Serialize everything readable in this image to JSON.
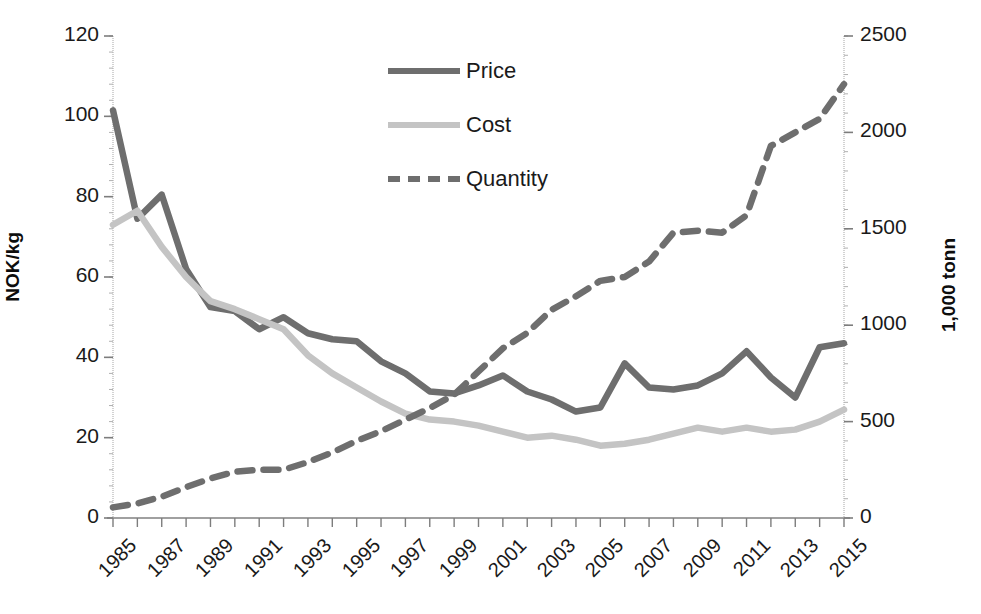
{
  "chart_data": {
    "type": "line",
    "title": "",
    "xlabel": "",
    "x": [
      1985,
      1986,
      1987,
      1988,
      1989,
      1990,
      1991,
      1992,
      1993,
      1994,
      1995,
      1996,
      1997,
      1998,
      1999,
      2000,
      2001,
      2002,
      2003,
      2004,
      2005,
      2006,
      2007,
      2008,
      2009,
      2010,
      2011,
      2012,
      2013,
      2014,
      2015
    ],
    "xtick_labels": [
      "1985",
      "1987",
      "1989",
      "1991",
      "1993",
      "1995",
      "1997",
      "1999",
      "2001",
      "2003",
      "2005",
      "2007",
      "2009",
      "2011",
      "2013",
      "2015"
    ],
    "xlim": [
      1985,
      2015
    ],
    "grid": false,
    "legend_position": "top-center",
    "axes": [
      {
        "id": "left",
        "label": "NOK/kg",
        "ticks": [
          0,
          20,
          40,
          60,
          80,
          100,
          120
        ],
        "lim": [
          0,
          120
        ]
      },
      {
        "id": "right",
        "label": "1,000 tonn",
        "ticks": [
          0,
          500,
          1000,
          1500,
          2000,
          2500
        ],
        "lim": [
          0,
          2500
        ]
      }
    ],
    "series": [
      {
        "name": "Price",
        "axis": "left",
        "style": "solid",
        "color": "#6e6e6e",
        "values": [
          101.5,
          74.5,
          80.5,
          62.0,
          52.5,
          51.5,
          47.0,
          50.0,
          46.0,
          44.5,
          44.0,
          39.0,
          36.0,
          31.5,
          31.0,
          33.0,
          35.5,
          31.5,
          29.5,
          26.5,
          27.5,
          38.5,
          32.5,
          32.0,
          33.0,
          36.0,
          41.5,
          35.0,
          30.0,
          42.5,
          43.5
        ]
      },
      {
        "name": "Cost",
        "axis": "left",
        "style": "solid",
        "color": "#c4c4c4",
        "values": [
          73.0,
          76.5,
          67.5,
          60.0,
          54.0,
          52.0,
          49.5,
          47.0,
          40.5,
          36.0,
          32.5,
          29.0,
          26.0,
          24.5,
          24.0,
          23.0,
          21.5,
          20.0,
          20.5,
          19.5,
          18.0,
          18.5,
          19.5,
          21.0,
          22.5,
          21.5,
          22.5,
          21.5,
          22.0,
          24.0,
          27.0
        ]
      },
      {
        "name": "Quantity",
        "axis": "right",
        "style": "dashed",
        "color": "#6e6e6e",
        "values": [
          55,
          75,
          110,
          160,
          205,
          240,
          250,
          250,
          290,
          340,
          400,
          450,
          510,
          570,
          640,
          760,
          880,
          960,
          1080,
          1150,
          1230,
          1250,
          1330,
          1480,
          1490,
          1480,
          1570,
          1930,
          2000,
          2070,
          2250
        ]
      }
    ]
  },
  "legend": {
    "items": [
      {
        "label": "Price"
      },
      {
        "label": "Cost"
      },
      {
        "label": "Quantity"
      }
    ]
  }
}
